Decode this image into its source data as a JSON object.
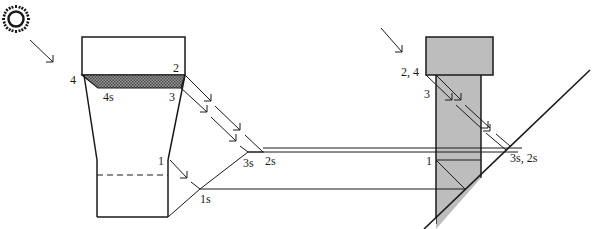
{
  "diagram": {
    "colors": {
      "ink": "#1a1a1a",
      "shade": "#bdbdbd",
      "hatch": "#6e6e6e",
      "background": "#ffffff"
    },
    "sun": {
      "icon": "sun-icon"
    },
    "left_figure": {
      "labels": {
        "p4": "4",
        "p2": "2",
        "p3": "3",
        "p4s": "4s",
        "p1": "1",
        "p3s": "3s",
        "p2s": "2s",
        "p1s": "1s"
      }
    },
    "right_figure": {
      "labels": {
        "p24": "2, 4",
        "p3": "3",
        "p1": "1",
        "p3s2s": "3s, 2s"
      }
    }
  }
}
